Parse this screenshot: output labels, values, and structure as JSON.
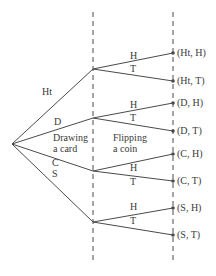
{
  "diagram": {
    "type": "tree",
    "colors": {
      "line": "#4a4a4a",
      "text": "#3a3a3a",
      "background": "#ffffff"
    },
    "stage_labels": {
      "stage1_line1": "Drawing",
      "stage1_line2": "a card",
      "stage2_line1": "Flipping",
      "stage2_line2": "a coin"
    },
    "root": {
      "x": 12,
      "y": 144
    },
    "stage1_x": 93,
    "stage2_x": 173,
    "dash_top": 12,
    "dash_bottom": 264,
    "card_branches": [
      {
        "label": "Ht",
        "node_y": 69,
        "label_x": 42,
        "label_y": 87,
        "coin": [
          {
            "label": "H",
            "leaf_y": 53,
            "label_x": 130,
            "label_y": 51,
            "outcome": "(Ht, H)"
          },
          {
            "label": "T",
            "leaf_y": 81,
            "label_x": 130,
            "label_y": 64,
            "outcome": "(Ht, T)"
          }
        ]
      },
      {
        "label": "D",
        "node_y": 118,
        "label_x": 54,
        "label_y": 117,
        "coin": [
          {
            "label": "H",
            "leaf_y": 103,
            "label_x": 130,
            "label_y": 100,
            "outcome": "(D, H)"
          },
          {
            "label": "T",
            "leaf_y": 131,
            "label_x": 130,
            "label_y": 113,
            "outcome": "(D, T)"
          }
        ]
      },
      {
        "label": "C",
        "node_y": 171,
        "label_x": 52,
        "label_y": 158,
        "coin": [
          {
            "label": "H",
            "leaf_y": 154,
            "label_x": 130,
            "label_y": 163,
            "outcome": "(C, H)"
          },
          {
            "label": "T",
            "leaf_y": 181,
            "label_x": 130,
            "label_y": 177,
            "outcome": "(C, T)"
          }
        ]
      },
      {
        "label": "S",
        "node_y": 222,
        "label_x": 52,
        "label_y": 169,
        "coin": [
          {
            "label": "H",
            "leaf_y": 208,
            "label_x": 130,
            "label_y": 202,
            "outcome": "(S, H)"
          },
          {
            "label": "T",
            "leaf_y": 235,
            "label_x": 130,
            "label_y": 216,
            "outcome": "(S, T)"
          }
        ]
      }
    ]
  }
}
